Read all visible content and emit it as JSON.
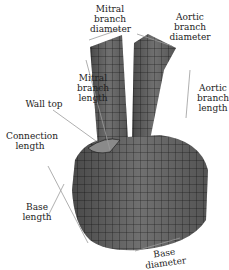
{
  "diagram": {
    "mesh_fill": "#6e6e6e",
    "mesh_line": "#1e1e1e",
    "arrow_color": "#9a9a9a",
    "labels": {
      "mitral_branch_diameter": "Mitral\nbranch\ndiameter",
      "aortic_branch_diameter": "Aortic\nbranch\ndiameter",
      "mitral_branch_length": "Mitral\nbranch\nlength",
      "aortic_branch_length": "Aortic\nbranch\nlength",
      "wall_top": "Wall top",
      "connection_length": "Connection\nlength",
      "base_length": "Base length",
      "base_diameter": "Base diameter"
    }
  }
}
